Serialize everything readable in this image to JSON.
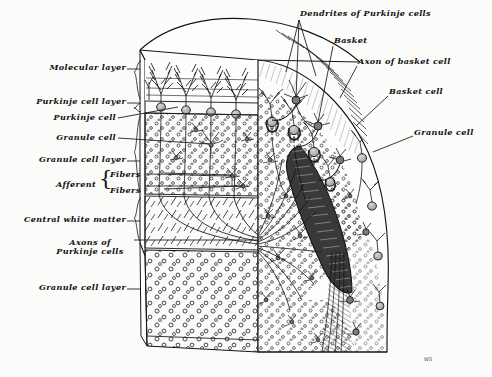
{
  "figure": {
    "background_color": "#fbfbfa",
    "ink_color": "#121212",
    "signature": "WS"
  },
  "labels_left": [
    {
      "id": "molecular-layer",
      "text": "Molecular layer",
      "x": 126,
      "y": 68,
      "leader_to_x": 146,
      "leader_to_y": 72
    },
    {
      "id": "purkinje-cell-layer",
      "text": "Purkinje cell layer",
      "x": 126,
      "y": 102,
      "leader_to_x": 146,
      "leader_to_y": 106
    },
    {
      "id": "purkinje-cell",
      "text": "Purkinje cell",
      "x": 116,
      "y": 121,
      "leader_to_x": 179,
      "leader_to_y": 106
    },
    {
      "id": "granule-cell",
      "text": "Granule cell",
      "x": 116,
      "y": 141,
      "leader_to_x": 210,
      "leader_to_y": 145
    },
    {
      "id": "granule-cell-layer-1",
      "text": "Granule cell layer",
      "x": 126,
      "y": 160,
      "leader_to_x": 146,
      "leader_to_y": 163
    },
    {
      "id": "central-white-matter",
      "text": "Central white matter",
      "x": 126,
      "y": 220,
      "leader_to_x": 146,
      "leader_to_y": 222
    },
    {
      "id": "granule-cell-layer-2",
      "text": "Granule cell layer",
      "x": 126,
      "y": 288,
      "leader_to_x": 146,
      "leader_to_y": 290
    }
  ],
  "labels_left_multiline": [
    {
      "id": "axons-of-purkinje-cells",
      "line1": "Axons of",
      "line2": "Purkinje cells",
      "x": 90,
      "y": 243
    }
  ],
  "labels_afferent": {
    "group_label": "Afferent",
    "group_x": 96,
    "group_y": 185,
    "brace": "{",
    "brace_x": 99,
    "brace_y": 178,
    "fibers": [
      {
        "id": "afferent-fibers-1",
        "text": "Fibers",
        "x": 132,
        "y": 176,
        "leader_to_x": 232,
        "leader_to_y": 176
      },
      {
        "id": "afferent-fibers-2",
        "text": "Fibers",
        "x": 132,
        "y": 192,
        "leader_to_x": 243,
        "leader_to_y": 186
      }
    ]
  },
  "labels_right": [
    {
      "id": "dendrites-of-purkinje-cells",
      "text": "Dendrites of Purkinje cells",
      "x": 300,
      "y": 14,
      "leader_to_x": 296,
      "leader_to_y": 100
    },
    {
      "id": "basket",
      "text": "Basket",
      "x": 334,
      "y": 41,
      "leader_to_x": 315,
      "leader_to_y": 120
    },
    {
      "id": "axon-of-basket-cell",
      "text": "Axon of basket cell",
      "x": 358,
      "y": 62,
      "leader_to_x": 340,
      "leader_to_y": 100
    },
    {
      "id": "basket-cell",
      "text": "Basket cell",
      "x": 389,
      "y": 92,
      "leader_to_x": 355,
      "leader_to_y": 126
    },
    {
      "id": "granule-cell-right",
      "text": "Granule cell",
      "x": 414,
      "y": 133,
      "leader_to_x": 372,
      "leader_to_y": 152
    }
  ],
  "anatomy": {
    "layers": [
      "Molecular layer",
      "Purkinje cell layer",
      "Granule cell layer",
      "Central white matter"
    ],
    "cell_types": [
      "Purkinje cell",
      "Granule cell",
      "Basket cell"
    ],
    "structures": [
      "Basket",
      "Axon of basket cell",
      "Dendrites of Purkinje cells",
      "Afferent fibers",
      "Axons of Purkinje cells"
    ]
  }
}
